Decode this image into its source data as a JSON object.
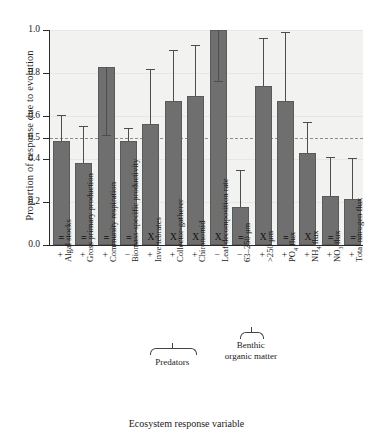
{
  "chart_data": {
    "type": "bar",
    "title": "",
    "xlabel": "Ecosystem response variable",
    "ylabel": "Proportion of response due to evolution",
    "ylim": [
      0.0,
      1.0
    ],
    "yticks": [
      0.0,
      0.2,
      0.4,
      0.5,
      0.6,
      0.8,
      1.0
    ],
    "ytick_labels": [
      "0.0",
      "0.2",
      "0.4",
      "0.5",
      "0.6",
      "0.8",
      "1.0"
    ],
    "grid": false,
    "legend": "none",
    "reference_line": {
      "value": 0.5,
      "style": "dashed"
    },
    "categories": [
      "Algal stocks",
      "Gross primary production",
      "Community respiration",
      "Biomass-specific productivity",
      "Invertebrates",
      "Collector-gatherer",
      "Chironomid",
      "Leaf decomposition rate",
      "63–250 μm",
      ">250 μm",
      "PO4 flux",
      "NH4 flux",
      "NO3 flux",
      "Total nitrogen flux"
    ],
    "category_labels_html": [
      "Algal stocks",
      "Gross primary production",
      "Community respiration",
      "Biomass-specific productivity",
      "Invertebrates",
      "Collector-gatherer",
      "Chironomid",
      "Leaf decomposition rate",
      "63–250 μm",
      "&gt;250 μm",
      "PO<sub>4</sub> flux",
      "NH<sub>4</sub> flux",
      "NO<sub>3</sub> flux",
      "Total nitrogen flux"
    ],
    "values": [
      0.485,
      0.38,
      0.828,
      0.485,
      0.563,
      0.67,
      0.693,
      1.0,
      0.175,
      0.74,
      0.67,
      0.43,
      0.23,
      0.213
    ],
    "error_upper": [
      0.605,
      0.555,
      0.828,
      0.545,
      0.82,
      0.905,
      0.932,
      1.0,
      0.35,
      0.965,
      0.99,
      0.57,
      0.41,
      0.405
    ],
    "error_lower": [
      0.485,
      0.38,
      0.513,
      0.485,
      0.563,
      0.67,
      0.693,
      0.765,
      0.175,
      0.74,
      0.67,
      0.43,
      0.23,
      0.213
    ],
    "direction_signs": [
      "+",
      "+",
      "+",
      "−",
      "+",
      "+",
      "+",
      "−",
      "−",
      "+",
      "+",
      "+",
      "+",
      "+"
    ],
    "in_bar_symbols": [
      "=",
      "=",
      "=",
      "=",
      "X",
      "X",
      "X",
      "X",
      "=",
      "X",
      "=",
      "X",
      "=",
      "="
    ],
    "groups": [
      {
        "label": "Predators",
        "from": 4,
        "to": 6
      },
      {
        "label": "Benthic organic matter",
        "from": 8,
        "to": 9
      }
    ]
  },
  "style": {
    "bar_color": "#6f6f6f",
    "plot_background": "#f2f2f0",
    "axis_color": "#2b2b2b",
    "reference_line_color": "#8c8c8c"
  }
}
